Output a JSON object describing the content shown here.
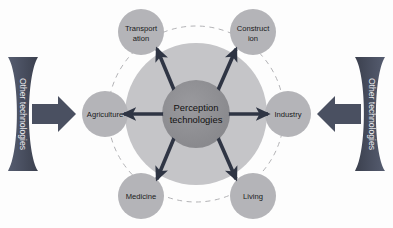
{
  "diagram": {
    "type": "hub-and-spoke",
    "background_color": "#fdfdfd",
    "hub": {
      "name": "perception-technologies-hub",
      "line1": "Perception",
      "line2": "technologies",
      "fill": "#8e8e92",
      "cx": 196,
      "cy": 114,
      "r": 34
    },
    "halo": {
      "name": "hub-halo",
      "fill": "#c3c3c6",
      "cx": 196,
      "cy": 114,
      "r": 71
    },
    "dashed_ring": {
      "name": "dashed-orbit-ring",
      "stroke": "#a8a8ac",
      "cx": 196,
      "cy": 114,
      "r": 88
    },
    "arrow_color": "#2f3544",
    "node_fill": "#b2b2b6",
    "nodes": [
      {
        "id": "transportation",
        "line1": "Transport",
        "line2": "ation",
        "cx": 141,
        "cy": 32,
        "r": 23,
        "angle": 124
      },
      {
        "id": "construction",
        "line1": "Construct",
        "line2": "ion",
        "cx": 253,
        "cy": 32,
        "r": 23,
        "angle": 56
      },
      {
        "id": "agriculture",
        "line1": "Agriculture",
        "line2": "",
        "cx": 105,
        "cy": 114,
        "r": 23,
        "angle": 180
      },
      {
        "id": "industry",
        "line1": "Industry",
        "line2": "",
        "cx": 288,
        "cy": 114,
        "r": 23,
        "angle": 0
      },
      {
        "id": "medicine",
        "line1": "Medicine",
        "line2": "",
        "cx": 141,
        "cy": 196,
        "r": 23,
        "angle": 236
      },
      {
        "id": "living",
        "line1": "Living",
        "line2": "",
        "cx": 253,
        "cy": 196,
        "r": 23,
        "angle": 304
      }
    ],
    "banners": [
      {
        "id": "left-banner",
        "label": "Other technologies",
        "side": "left",
        "fill": "#4a5061",
        "arrow_direction": "right"
      },
      {
        "id": "right-banner",
        "label": "Other technologies",
        "side": "right",
        "fill": "#4a5061",
        "arrow_direction": "left"
      }
    ]
  }
}
